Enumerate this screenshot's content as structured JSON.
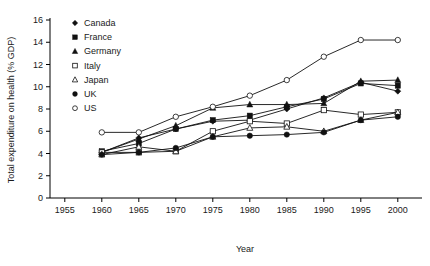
{
  "chart_data": {
    "type": "line",
    "title": "",
    "xlabel": "Year",
    "ylabel": "Total expenditure on health (% GDP)",
    "xlim": [
      1953,
      2003
    ],
    "ylim": [
      0,
      16
    ],
    "xticks": [
      1955,
      1960,
      1965,
      1970,
      1975,
      1980,
      1985,
      1990,
      1995,
      2000
    ],
    "yticks": [
      0,
      2,
      4,
      6,
      8,
      10,
      12,
      14,
      16
    ],
    "grid": false,
    "legend_position": "top-left",
    "x": [
      1960,
      1965,
      1970,
      1975,
      1980,
      1985,
      1990,
      1995,
      2000
    ],
    "series": [
      {
        "name": "Canada",
        "marker": "diamond-filled",
        "color": "#111111",
        "values": [
          4.1,
          5.4,
          6.2,
          6.9,
          7.0,
          8.0,
          9.0,
          10.4,
          9.6
        ]
      },
      {
        "name": "France",
        "marker": "square-filled",
        "color": "#111111",
        "values": [
          4.2,
          4.9,
          6.2,
          7.0,
          7.4,
          8.2,
          8.9,
          10.3,
          10.1
        ]
      },
      {
        "name": "Germany",
        "marker": "triangle-filled",
        "color": "#111111",
        "values": [
          4.1,
          5.3,
          6.5,
          8.1,
          8.4,
          8.4,
          8.5,
          10.5,
          10.6
        ]
      },
      {
        "name": "Italy",
        "marker": "square-open",
        "color": "#111111",
        "values": [
          4.1,
          4.1,
          4.2,
          6.0,
          6.9,
          6.7,
          7.9,
          7.5,
          7.7
        ]
      },
      {
        "name": "Japan",
        "marker": "triangle-open",
        "color": "#111111",
        "values": [
          3.9,
          4.6,
          4.2,
          5.5,
          6.3,
          6.4,
          6.0,
          7.0,
          7.7
        ]
      },
      {
        "name": "UK",
        "marker": "circle-filled",
        "color": "#111111",
        "values": [
          3.9,
          4.1,
          4.5,
          5.5,
          5.6,
          5.7,
          5.9,
          7.0,
          7.3
        ]
      },
      {
        "name": "US",
        "marker": "circle-open",
        "color": "#111111",
        "values": [
          5.9,
          5.9,
          7.3,
          8.2,
          9.2,
          10.6,
          12.7,
          14.2,
          14.2
        ]
      }
    ]
  },
  "legend": {
    "entries": [
      {
        "label": "Canada",
        "marker": "diamond-filled"
      },
      {
        "label": "France",
        "marker": "square-filled"
      },
      {
        "label": "Germany",
        "marker": "triangle-filled"
      },
      {
        "label": "Italy",
        "marker": "square-open"
      },
      {
        "label": "Japan",
        "marker": "triangle-open"
      },
      {
        "label": "UK",
        "marker": "circle-filled"
      },
      {
        "label": "US",
        "marker": "circle-open"
      }
    ]
  },
  "style": {
    "axis_color": "#000000",
    "text_color": "#1a1a1a",
    "series_color": "#111111",
    "background": "#ffffff"
  }
}
